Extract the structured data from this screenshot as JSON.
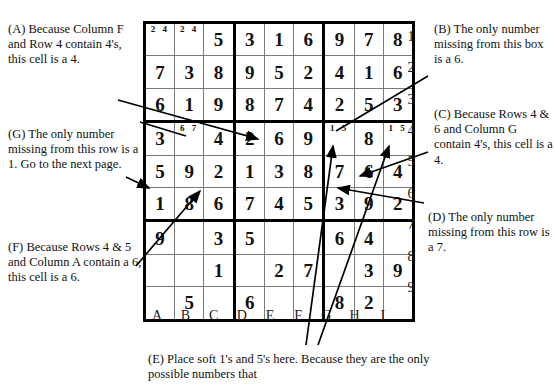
{
  "grid": {
    "column_labels": [
      "A",
      "B",
      "C",
      "D",
      "E",
      "F",
      "G",
      "H",
      "I"
    ],
    "row_labels": [
      "1",
      "2",
      "3",
      "4",
      "5",
      "6",
      "7",
      "8",
      "9"
    ],
    "cells": [
      [
        {
          "value": "",
          "pencil": "2 4"
        },
        {
          "value": "",
          "pencil": "2 4"
        },
        {
          "value": "5",
          "pencil": ""
        },
        {
          "value": "3",
          "pencil": ""
        },
        {
          "value": "1",
          "pencil": ""
        },
        {
          "value": "6",
          "pencil": ""
        },
        {
          "value": "9",
          "pencil": ""
        },
        {
          "value": "7",
          "pencil": ""
        },
        {
          "value": "8",
          "pencil": ""
        }
      ],
      [
        {
          "value": "7",
          "pencil": ""
        },
        {
          "value": "3",
          "pencil": ""
        },
        {
          "value": "8",
          "pencil": ""
        },
        {
          "value": "9",
          "pencil": ""
        },
        {
          "value": "5",
          "pencil": ""
        },
        {
          "value": "2",
          "pencil": ""
        },
        {
          "value": "4",
          "pencil": ""
        },
        {
          "value": "1",
          "pencil": ""
        },
        {
          "value": "6",
          "pencil": ""
        }
      ],
      [
        {
          "value": "6",
          "pencil": ""
        },
        {
          "value": "1",
          "pencil": ""
        },
        {
          "value": "9",
          "pencil": ""
        },
        {
          "value": "8",
          "pencil": ""
        },
        {
          "value": "7",
          "pencil": ""
        },
        {
          "value": "4",
          "pencil": ""
        },
        {
          "value": "2",
          "pencil": ""
        },
        {
          "value": "5",
          "pencil": ""
        },
        {
          "value": "3",
          "pencil": ""
        }
      ],
      [
        {
          "value": "3",
          "pencil": ""
        },
        {
          "value": "",
          "pencil": "6 7"
        },
        {
          "value": "4",
          "pencil": ""
        },
        {
          "value": "2",
          "pencil": ""
        },
        {
          "value": "6",
          "pencil": ""
        },
        {
          "value": "9",
          "pencil": ""
        },
        {
          "value": "",
          "pencil": "1 5"
        },
        {
          "value": "8",
          "pencil": ""
        },
        {
          "value": "",
          "pencil": "1 5"
        }
      ],
      [
        {
          "value": "5",
          "pencil": ""
        },
        {
          "value": "9",
          "pencil": ""
        },
        {
          "value": "2",
          "pencil": ""
        },
        {
          "value": "1",
          "pencil": ""
        },
        {
          "value": "3",
          "pencil": ""
        },
        {
          "value": "8",
          "pencil": ""
        },
        {
          "value": "7",
          "pencil": ""
        },
        {
          "value": "6",
          "pencil": ""
        },
        {
          "value": "4",
          "pencil": ""
        }
      ],
      [
        {
          "value": "1",
          "pencil": ""
        },
        {
          "value": "8",
          "pencil": ""
        },
        {
          "value": "6",
          "pencil": ""
        },
        {
          "value": "7",
          "pencil": ""
        },
        {
          "value": "4",
          "pencil": ""
        },
        {
          "value": "5",
          "pencil": ""
        },
        {
          "value": "3",
          "pencil": ""
        },
        {
          "value": "9",
          "pencil": ""
        },
        {
          "value": "2",
          "pencil": ""
        }
      ],
      [
        {
          "value": "9",
          "pencil": ""
        },
        {
          "value": "",
          "pencil": ""
        },
        {
          "value": "3",
          "pencil": ""
        },
        {
          "value": "5",
          "pencil": ""
        },
        {
          "value": "",
          "pencil": ""
        },
        {
          "value": "",
          "pencil": ""
        },
        {
          "value": "6",
          "pencil": ""
        },
        {
          "value": "4",
          "pencil": ""
        },
        {
          "value": "",
          "pencil": ""
        }
      ],
      [
        {
          "value": "",
          "pencil": ""
        },
        {
          "value": "",
          "pencil": ""
        },
        {
          "value": "1",
          "pencil": ""
        },
        {
          "value": "",
          "pencil": ""
        },
        {
          "value": "2",
          "pencil": ""
        },
        {
          "value": "7",
          "pencil": ""
        },
        {
          "value": "",
          "pencil": ""
        },
        {
          "value": "3",
          "pencil": ""
        },
        {
          "value": "9",
          "pencil": ""
        }
      ],
      [
        {
          "value": "",
          "pencil": ""
        },
        {
          "value": "5",
          "pencil": ""
        },
        {
          "value": "",
          "pencil": ""
        },
        {
          "value": "6",
          "pencil": ""
        },
        {
          "value": "",
          "pencil": ""
        },
        {
          "value": "",
          "pencil": ""
        },
        {
          "value": "8",
          "pencil": ""
        },
        {
          "value": "2",
          "pencil": ""
        },
        {
          "value": "",
          "pencil": ""
        }
      ]
    ]
  },
  "notes": {
    "a": "(A) Because Column F and Row 4 contain 4's, this cell is a 4.",
    "b": "(B) The only number missing from this box is a 6.",
    "c": "(C) Because Rows 4 & 6 and Column G contain 4's, this cell is a 4.",
    "d": "(D) The only number missing from this row is a 7.",
    "e": "(E) Place soft 1's and 5's here. Because they are the only possible numbers that",
    "f": "(F) Because Rows 4 & 5 and Column A contain a 6, this cell is a 6.",
    "g": "(G) The only number missing from this row is a 1. Go to the next page."
  },
  "colors": {
    "ink": "#111111",
    "grid_thin": "#7a7a7a",
    "grid_thick": "#000000",
    "background": "#ffffff"
  }
}
